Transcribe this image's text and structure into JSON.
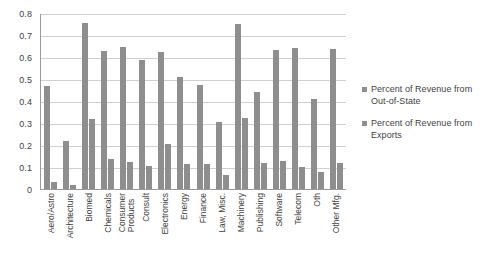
{
  "chart_data": {
    "type": "bar",
    "title": "",
    "subtitle": "",
    "xlabel": "",
    "ylabel": "",
    "ylim": [
      0,
      0.8
    ],
    "y_ticks": [
      "0",
      "0.1",
      "0.2",
      "0.3",
      "0.4",
      "0.5",
      "0.6",
      "0.7",
      "0.8"
    ],
    "y_tick_values": [
      0,
      0.1,
      0.2,
      0.3,
      0.4,
      0.5,
      0.6,
      0.7,
      0.8
    ],
    "grid": true,
    "legend_position": "right",
    "bar_color": "#8e8e8e",
    "categories": [
      "Aero/Astro",
      "Architecture",
      "Biomed",
      "Chemicals",
      "Consumer Products",
      "Consult",
      "Electronics",
      "Energy",
      "Finance",
      "Law, Misc.",
      "Machinery",
      "Publishing",
      "Software",
      "Telecom",
      "Oth",
      "Other Mfg."
    ],
    "category_lines": [
      [
        "Aero/Astro"
      ],
      [
        "Architecture"
      ],
      [
        "Biomed"
      ],
      [
        "Chemicals"
      ],
      [
        "Consumer",
        "Products"
      ],
      [
        "Consult"
      ],
      [
        "Electronics"
      ],
      [
        "Energy"
      ],
      [
        "Finance"
      ],
      [
        "Law, Misc."
      ],
      [
        "Machinery"
      ],
      [
        "Publishing"
      ],
      [
        "Software"
      ],
      [
        "Telecom"
      ],
      [
        "Oth"
      ],
      [
        "Other Mfg."
      ]
    ],
    "series": [
      {
        "name": "Percent of Revenue from Out-of-State",
        "legend_lines": [
          "Percent of Revenue from",
          "Out-of-State"
        ],
        "color": "#8e8e8e",
        "values": [
          0.47,
          0.22,
          0.76,
          0.63,
          0.65,
          0.59,
          0.625,
          0.51,
          0.475,
          0.305,
          0.755,
          0.445,
          0.635,
          0.645,
          0.41,
          0.64
        ]
      },
      {
        "name": "Percent of Revenue from Exports",
        "legend_lines": [
          "Percent of Revenue from",
          "Exports"
        ],
        "color": "#8e8e8e",
        "values": [
          0.03,
          0.02,
          0.32,
          0.135,
          0.125,
          0.105,
          0.205,
          0.115,
          0.115,
          0.065,
          0.325,
          0.12,
          0.13,
          0.1,
          0.08,
          0.12
        ]
      }
    ]
  }
}
